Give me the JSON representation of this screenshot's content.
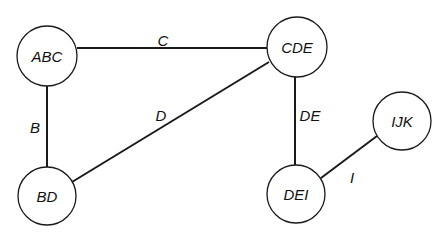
{
  "diagram": {
    "type": "graph",
    "nodes": [
      {
        "id": "ABC",
        "label": "ABC",
        "cx": 47,
        "cy": 56,
        "r": 30
      },
      {
        "id": "CDE",
        "label": "CDE",
        "cx": 297,
        "cy": 47,
        "r": 30
      },
      {
        "id": "BD",
        "label": "BD",
        "cx": 47,
        "cy": 196,
        "r": 29
      },
      {
        "id": "DEI",
        "label": "DEI",
        "cx": 296,
        "cy": 194,
        "r": 29
      },
      {
        "id": "IJK",
        "label": "IJK",
        "cx": 402,
        "cy": 121,
        "r": 29
      }
    ],
    "edges": [
      {
        "from": "ABC",
        "to": "CDE",
        "label": "C",
        "x1": 77,
        "y1": 48,
        "x2": 267,
        "y2": 48,
        "lx": 163,
        "ly": 40
      },
      {
        "from": "ABC",
        "to": "BD",
        "label": "B",
        "x1": 47,
        "y1": 86,
        "x2": 47,
        "y2": 167,
        "lx": 35,
        "ly": 127
      },
      {
        "from": "CDE",
        "to": "BD",
        "label": "D",
        "x1": 269,
        "y1": 62,
        "x2": 72,
        "y2": 182,
        "lx": 161,
        "ly": 115
      },
      {
        "from": "CDE",
        "to": "DEI",
        "label": "DE",
        "x1": 295,
        "y1": 77,
        "x2": 295,
        "y2": 165,
        "lx": 310,
        "ly": 115
      },
      {
        "from": "DEI",
        "to": "IJK",
        "label": "I",
        "x1": 321,
        "y1": 178,
        "x2": 377,
        "y2": 136,
        "lx": 352,
        "ly": 177
      }
    ]
  }
}
